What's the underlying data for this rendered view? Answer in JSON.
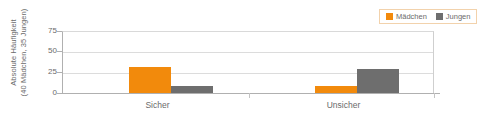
{
  "chart_data": {
    "type": "bar",
    "title": "",
    "xlabel": "",
    "ylabel_line1": "Absolute Häufigkeit",
    "ylabel_line2": "(40 Mädchen, 35 Jungen)",
    "categories": [
      "Sicher",
      "Unsicher"
    ],
    "series": [
      {
        "name": "Mädchen",
        "color": "#F28A0C",
        "values": [
          31,
          8
        ]
      },
      {
        "name": "Jungen",
        "color": "#6E6E6E",
        "values": [
          9,
          29
        ]
      }
    ],
    "ylim": [
      0,
      75
    ],
    "yticks": [
      0,
      25,
      50,
      75
    ],
    "ytick_labels": [
      "0",
      "25",
      "50",
      "75"
    ],
    "grid": true,
    "legend_position": "top-right"
  },
  "legend": {
    "items": [
      {
        "label": "Mädchen",
        "color": "#F28A0C"
      },
      {
        "label": "Jungen",
        "color": "#6E6E6E"
      }
    ]
  }
}
